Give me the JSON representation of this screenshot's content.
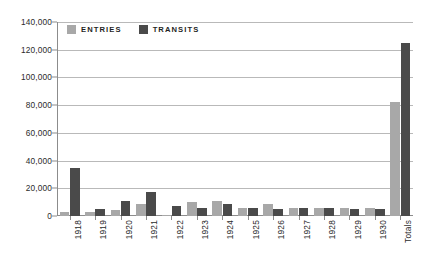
{
  "chart_data": {
    "type": "bar",
    "title": "",
    "xlabel": "",
    "ylabel": "",
    "ylim": [
      0,
      140000
    ],
    "ytick_step": 20000,
    "ytick_labels": [
      "0",
      "20,000",
      "40,000",
      "60,000",
      "80,000",
      "100,000",
      "120,000",
      "140,000"
    ],
    "ytick_values": [
      0,
      20000,
      40000,
      60000,
      80000,
      100000,
      120000,
      140000
    ],
    "grid": true,
    "legend_position": "top-left",
    "categories": [
      "1918",
      "1919",
      "1920",
      "1921",
      "1922",
      "1923",
      "1924",
      "1925",
      "1926",
      "1927",
      "1928",
      "1929",
      "1930",
      "Totals"
    ],
    "series": [
      {
        "name": "ENTRIES",
        "color": "#a8a8a8",
        "values": [
          2800,
          3200,
          4500,
          8500,
          1000,
          10000,
          11000,
          6000,
          9000,
          5500,
          6000,
          6000,
          5800,
          82000
        ]
      },
      {
        "name": "TRANSITS",
        "color": "#4a4a4a",
        "values": [
          34500,
          5000,
          11000,
          17500,
          7500,
          5800,
          9000,
          6000,
          5000,
          5500,
          5500,
          5200,
          5000,
          125000
        ]
      }
    ]
  },
  "legend": {
    "items": [
      {
        "label": "ENTRIES",
        "color": "#a8a8a8"
      },
      {
        "label": "TRANSITS",
        "color": "#4a4a4a"
      }
    ]
  },
  "colors": {
    "background": "#ffffff",
    "axis": "#8c8c8c",
    "gridline": "#b9b9b9",
    "text": "#2b2b2b",
    "entries": "#a8a8a8",
    "transits": "#4a4a4a"
  }
}
